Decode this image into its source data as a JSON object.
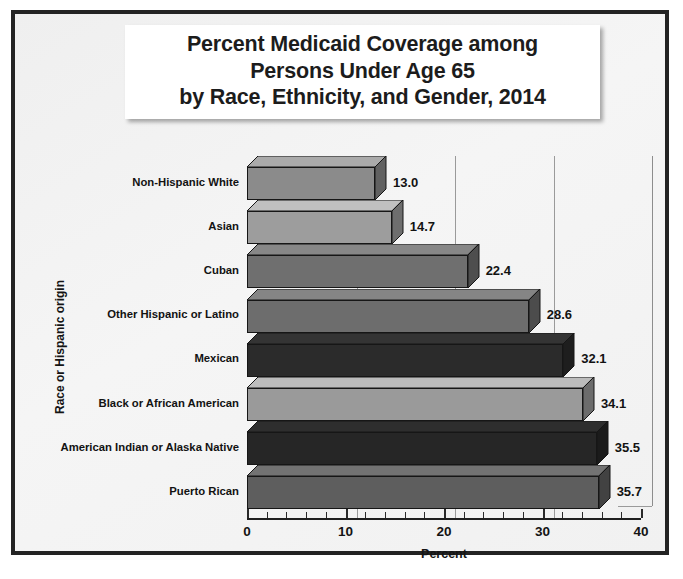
{
  "title": {
    "lines": [
      "Percent Medicaid Coverage among",
      "Persons Under Age 65",
      "by Race, Ethnicity, and Gender, 2014"
    ]
  },
  "axes": {
    "y_title": "Race or Hispanic origin",
    "x_title": "Percent",
    "x_ticks": [
      "0",
      "10",
      "20",
      "30",
      "40"
    ]
  },
  "chart_data": {
    "type": "bar",
    "orientation": "horizontal",
    "title": "Percent Medicaid Coverage among Persons Under Age 65 by Race, Ethnicity, and Gender, 2014",
    "xlabel": "Percent",
    "ylabel": "Race or Hispanic origin",
    "xlim": [
      0,
      40
    ],
    "xticks": [
      0,
      10,
      20,
      30,
      40
    ],
    "minor_tick_step": 2,
    "grid": "vertical",
    "legend": "none",
    "categories": [
      "Non-Hispanic White",
      "Asian",
      "Cuban",
      "Other Hispanic or Latino",
      "Mexican",
      "Black or African American",
      "American Indian or Alaska Native",
      "Puerto Rican"
    ],
    "values": [
      13.0,
      14.7,
      22.4,
      28.6,
      32.1,
      34.1,
      35.5,
      35.7
    ],
    "value_labels": [
      "13.0",
      "14.7",
      "22.4",
      "28.6",
      "32.1",
      "34.1",
      "35.5",
      "35.7"
    ],
    "bar_colors": [
      "#8b8b8b",
      "#9d9d9d",
      "#6f6f6f",
      "#6d6d6d",
      "#2b2b2b",
      "#9a9a9a",
      "#262626",
      "#5e5e5e"
    ]
  },
  "colors": {
    "frame": "#232323",
    "background": "#f2f2f2",
    "gridline": "#9a9a9a",
    "text": "#121212"
  }
}
